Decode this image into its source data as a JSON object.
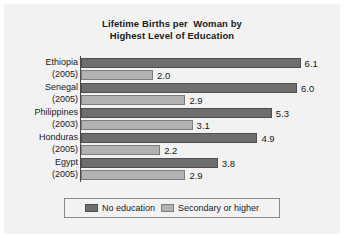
{
  "chart_data": {
    "type": "bar",
    "orientation": "horizontal",
    "title": "Lifetime Births per  Woman by\nHighest Level of Education",
    "title_line1": "Lifetime Births per  Woman by",
    "title_line2": "Highest Level of Education",
    "xlabel": "",
    "ylabel": "",
    "xlim": [
      0,
      6.5
    ],
    "grid": false,
    "legend_position": "bottom",
    "categories": [
      "Ethiopia",
      "Senegal",
      "Philippines",
      "Honduras",
      "Egypt"
    ],
    "category_years": [
      "(2005)",
      "(2005)",
      "(2003)",
      "(2005)",
      "(2005)"
    ],
    "series": [
      {
        "name": "No education",
        "color": "#6e6e6e",
        "values": [
          6.1,
          6.0,
          5.3,
          4.9,
          3.8
        ],
        "labels": [
          "6.1",
          "6.0",
          "5.3",
          "4.9",
          "3.8"
        ]
      },
      {
        "name": "Secondary or higher",
        "color": "#b2b2b2",
        "values": [
          2.0,
          2.9,
          3.1,
          2.2,
          2.9
        ],
        "labels": [
          "2.0",
          "2.9",
          "3.1",
          "2.2",
          "2.9"
        ]
      }
    ]
  },
  "legend": {
    "entries": [
      {
        "label": "No education",
        "swatch": "dark-gray-swatch"
      },
      {
        "label": "Secondary or higher",
        "swatch": "light-gray-swatch"
      }
    ]
  }
}
